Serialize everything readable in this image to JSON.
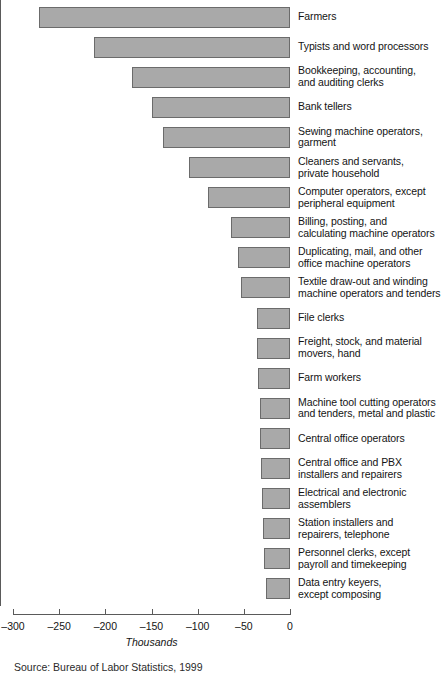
{
  "chart_data": {
    "type": "bar",
    "orientation": "horizontal",
    "title": "",
    "xlabel": "Thousands",
    "ylabel": "",
    "xlim": [
      -300,
      0
    ],
    "xticks": [
      -300,
      -250,
      -200,
      -150,
      -100,
      -50,
      0
    ],
    "xtick_labels": [
      "–300",
      "–250",
      "–200",
      "–150",
      "–100",
      "–50",
      "0"
    ],
    "grid": false,
    "legend": "none",
    "bar_color": "#a9a9a9",
    "bar_edge_color": "#6b6b6b",
    "axis_color": "#5a5a5a",
    "categories": [
      "Farmers",
      "Typists and word processors",
      "Bookkeeping, accounting,\nand auditing clerks",
      "Bank tellers",
      "Sewing machine operators,\ngarment",
      "Cleaners and servants,\nprivate household",
      "Computer operators, except\nperipheral equipment",
      "Billing, posting, and\ncalculating machine operators",
      "Duplicating, mail, and other\noffice machine operators",
      "Textile draw-out and winding\nmachine operators and tenders",
      "File clerks",
      "Freight, stock, and material\nmovers, hand",
      "Farm workers",
      "Machine tool cutting operators\nand tenders, metal and plastic",
      "Central office operators",
      "Central office and PBX\ninstallers and repairers",
      "Electrical and electronic\nassemblers",
      "Station installers and\nrepairers, telephone",
      "Personnel clerks, except\npayroll and timekeeping",
      "Data entry keyers,\nexcept composing"
    ],
    "values": [
      -272,
      -212,
      -171,
      -150,
      -138,
      -109,
      -89,
      -64,
      -56,
      -53,
      -36,
      -36,
      -35,
      -33,
      -32,
      -31,
      -30,
      -29,
      -28,
      -26
    ]
  },
  "footer": {
    "source": "Source: Bureau of Labor Statistics, 1999"
  }
}
